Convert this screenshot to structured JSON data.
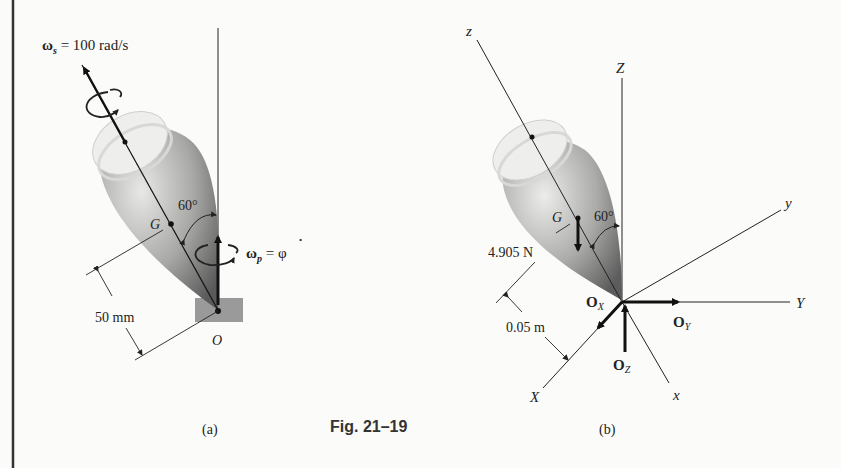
{
  "figure": {
    "caption": "Fig. 21–19",
    "panels": [
      {
        "id": "a",
        "label": "(a)",
        "spin_label_sym": "ω",
        "spin_label_sub": "s",
        "spin_label_rest": " = 100 rad/s",
        "precession_sym": "ω",
        "precession_sub": "p",
        "precession_rest": " = φ",
        "precession_dot": "•",
        "angle": "60°",
        "center_of_mass": "G",
        "pivot": "O",
        "distance": "50 mm"
      },
      {
        "id": "b",
        "label": "(b)",
        "angle": "60°",
        "center_of_mass": "G",
        "weight": "4.905 N",
        "distance": "0.05 m",
        "axes": {
          "z_body": "z",
          "Z_fixed": "Z",
          "y_body": "y",
          "Y_fixed": "Y",
          "X_fixed": "X",
          "x_body": "x"
        },
        "reactions": {
          "ox": "O",
          "ox_sub": "X",
          "oy": "O",
          "oy_sub": "Y",
          "oz": "O",
          "oz_sub": "Z"
        }
      }
    ]
  },
  "colors": {
    "ink": "#222222",
    "background": "#fbfbf9",
    "body_light": "#e6e6e4",
    "body_dark": "#6e6e6e"
  }
}
